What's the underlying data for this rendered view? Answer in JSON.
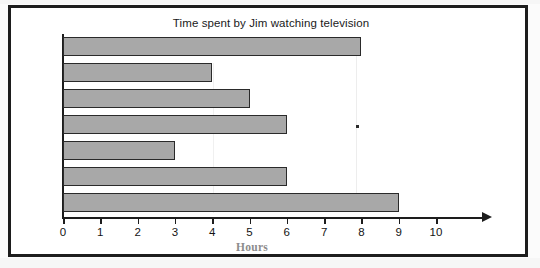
{
  "chart_data": {
    "type": "bar",
    "orientation": "horizontal",
    "title": "Time spent by Jim watching television",
    "xlabel": "Hours",
    "ylabel": "",
    "categories": [
      "Sun",
      "Mon",
      "Tue",
      "Wed",
      "Thu",
      "Fri",
      "Sat"
    ],
    "values": [
      8,
      4,
      5,
      6,
      3,
      6,
      9
    ],
    "xticks": [
      "0",
      "1",
      "2",
      "3",
      "4",
      "5",
      "6",
      "7",
      "8",
      "9",
      "10"
    ],
    "xlim": [
      0,
      10
    ],
    "grid": false,
    "legend": false,
    "bar_fill_color": "#a8a8a8",
    "bar_border_color": "#2a2a2a",
    "axis_color": "#1d1d1d",
    "xlabel_color": "#8c8c8c",
    "frame_color": "#1d1d1d",
    "background_color": "#ffffff"
  },
  "axis": {
    "arrow_icon": "arrow-right-icon"
  },
  "artifacts": {
    "speck": "scan-speck",
    "streak": "scan-streak"
  }
}
